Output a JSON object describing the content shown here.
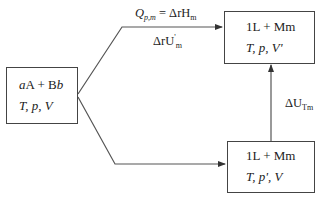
{
  "diagram": {
    "type": "thermodynamic-path-diagram",
    "nodes": {
      "initial": {
        "line1": {
          "a": "a",
          "A": "A",
          "plus": " + ",
          "B": "B",
          "b": "b"
        },
        "line2": "T, p, V"
      },
      "final_const_p": {
        "line1": "1L + Mm",
        "line2": "T, p, V'"
      },
      "final_const_v": {
        "line1": "1L + Mm",
        "line2": "T, p', V"
      }
    },
    "edges": {
      "upper": {
        "label_top": {
          "Q": "Q",
          "Q_sub": "p,m",
          "eq": " = ΔrH",
          "H_sub": "m"
        },
        "label_bottom": {
          "main": "ΔrU",
          "sup": "'",
          "sub": "m"
        }
      },
      "vertical": {
        "label": {
          "main": "ΔU",
          "sub": "Tm"
        }
      },
      "lower": {}
    },
    "colors": {
      "stroke": "#444444",
      "text": "#222222",
      "background": "#ffffff"
    }
  }
}
